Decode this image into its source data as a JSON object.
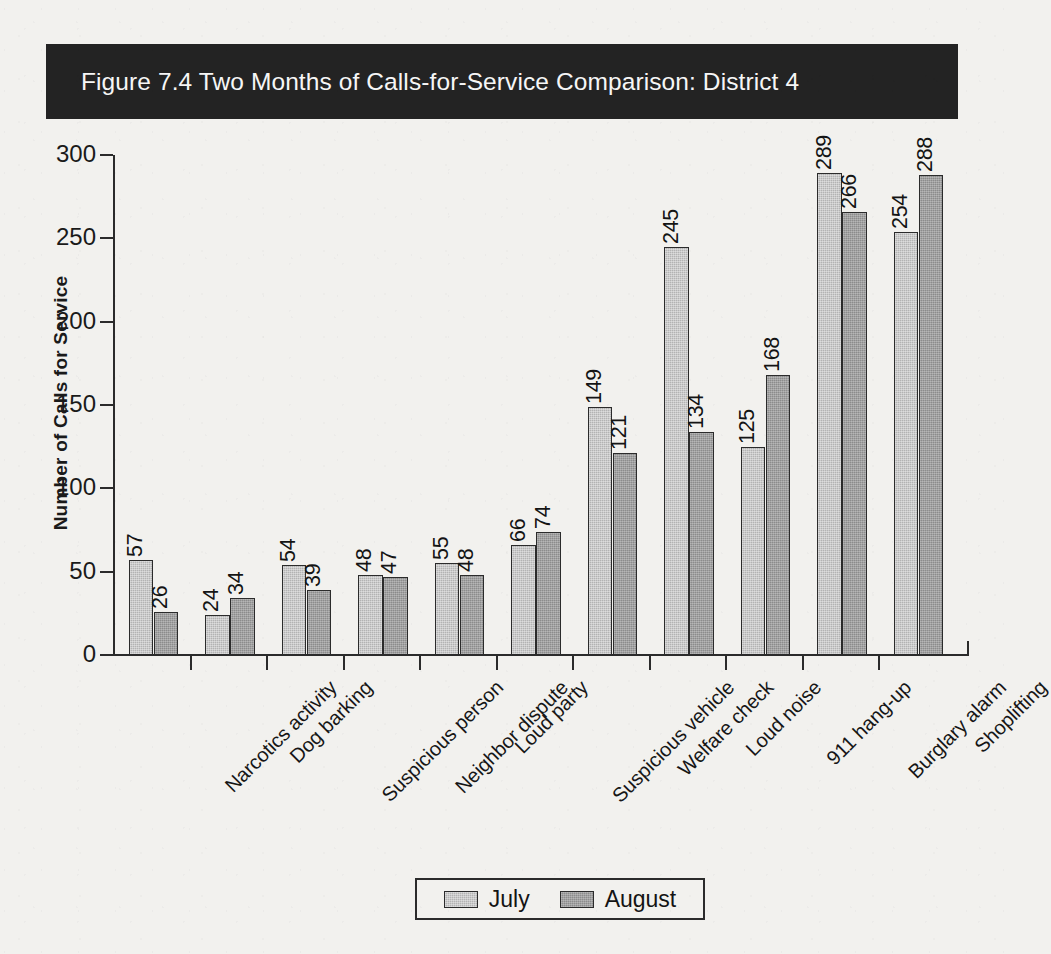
{
  "figure": {
    "title": "Figure 7.4   Two Months of Calls-for-Service Comparison: District 4",
    "banner_color": "#232323",
    "banner_text_color": "#f6f6f6"
  },
  "chart_data": {
    "type": "bar",
    "title": "Figure 7.4   Two Months of Calls-for-Service Comparison: District 4",
    "xlabel": "",
    "ylabel": "Number of Calls for Service",
    "ylim": [
      0,
      300
    ],
    "ytick_labels": [
      "0",
      "50",
      "100",
      "150",
      "200",
      "250",
      "300"
    ],
    "ytick_values": [
      0,
      50,
      100,
      150,
      200,
      250,
      300
    ],
    "grid": false,
    "legend_position": "bottom-center",
    "categories": [
      "Narcotics activity",
      "Dog barking",
      "Suspicious person",
      "Neighbor dispute",
      "Loud party",
      "Suspicious vehicle",
      "Welfare check",
      "Loud noise",
      "911 hang-up",
      "Burglary alarm",
      "Shoplifting"
    ],
    "series": [
      {
        "name": "July",
        "color": "#b3b3b3",
        "values": [
          57,
          24,
          54,
          48,
          55,
          66,
          149,
          245,
          125,
          289,
          254
        ]
      },
      {
        "name": "August",
        "color": "#8c8c8c",
        "values": [
          26,
          34,
          39,
          47,
          48,
          74,
          121,
          134,
          168,
          266,
          288
        ]
      }
    ]
  }
}
